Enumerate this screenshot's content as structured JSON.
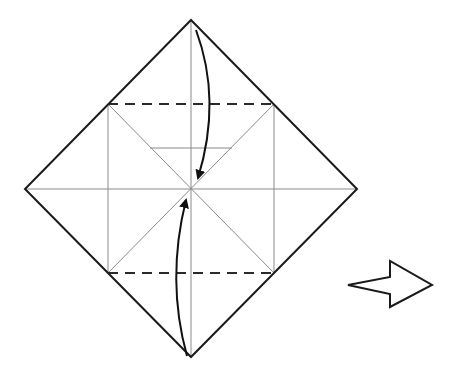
{
  "diagram": {
    "kind": "origami-step",
    "colors": {
      "outline": "#1a1a1a",
      "crease": "#8a8a8a",
      "fold_line": "#2a2a2a",
      "arrow": "#111111",
      "background": "#ffffff"
    },
    "folds": [
      {
        "name": "top-valley-fold",
        "type": "dashed",
        "action": "fold top corner to center"
      },
      {
        "name": "bottom-valley-fold",
        "type": "dashed",
        "action": "fold bottom corner to center"
      }
    ],
    "next_step_indicator": "hollow-right-arrow"
  }
}
